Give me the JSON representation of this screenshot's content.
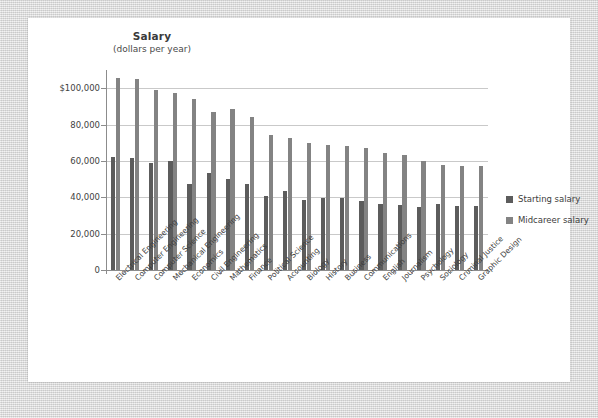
{
  "chart_data": {
    "type": "bar",
    "title": "Salary",
    "subtitle": "(dollars per year)",
    "xlabel": "",
    "ylabel": "",
    "ylim": [
      0,
      110000
    ],
    "grid": true,
    "legend_position": "right",
    "ytick_labels": [
      "$100,000",
      "80,000",
      "60,000",
      "40,000",
      "20,000",
      "0"
    ],
    "ytick_values": [
      100000,
      80000,
      60000,
      40000,
      20000,
      0
    ],
    "categories": [
      "Electrical Engineering",
      "Computer Engineering",
      "Computer Science",
      "Mechanical Engineering",
      "Economics",
      "Civil Engineering",
      "Mathematics",
      "Finance",
      "Political Science",
      "Accounting",
      "Biology",
      "History",
      "Business",
      "Communications",
      "English",
      "Journalism",
      "Psychology",
      "Sociology",
      "Criminal Justice",
      "Graphic Design"
    ],
    "series": [
      {
        "name": "Starting salary",
        "color": "#5c5c5c",
        "values": [
          62000,
          61500,
          59000,
          60000,
          47500,
          53500,
          50000,
          47500,
          40500,
          43500,
          38500,
          39500,
          39500,
          38000,
          36500,
          36000,
          34500,
          36500,
          35000,
          35000
        ]
      },
      {
        "name": "Midcareer salary",
        "color": "#838383",
        "values": [
          105500,
          105000,
          99000,
          97500,
          94000,
          87000,
          88500,
          84000,
          74000,
          72500,
          70000,
          69000,
          68000,
          67000,
          64500,
          63500,
          60000,
          57500,
          57000,
          57000
        ]
      }
    ]
  },
  "legend": {
    "items": [
      {
        "label": "Starting salary",
        "color": "#5c5c5c"
      },
      {
        "label": "Midcareer salary",
        "color": "#838383"
      }
    ]
  }
}
